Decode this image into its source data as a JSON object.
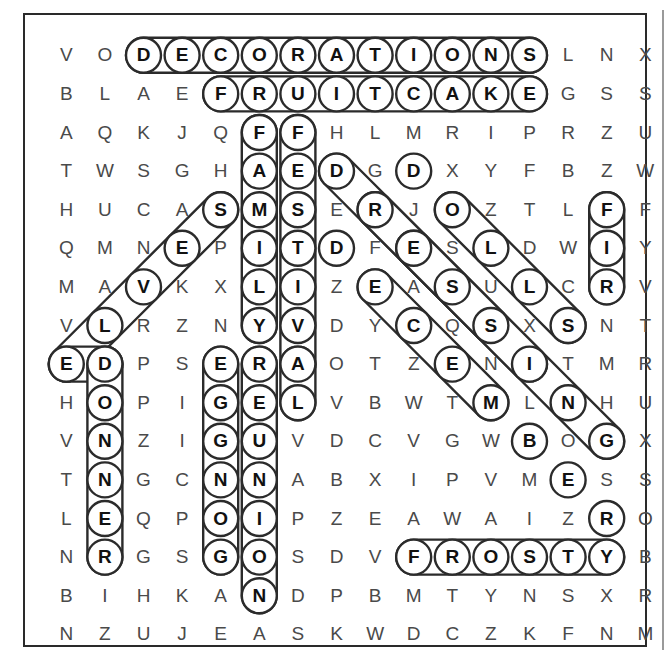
{
  "puzzle": {
    "type": "word-search",
    "rows": 16,
    "cols": 15,
    "grid": [
      [
        "V",
        "O",
        "D",
        "E",
        "C",
        "O",
        "R",
        "A",
        "T",
        "I",
        "O",
        "N",
        "S",
        "L",
        "N",
        "X"
      ],
      [
        "B",
        "L",
        "A",
        "E",
        "F",
        "R",
        "U",
        "I",
        "T",
        "C",
        "A",
        "K",
        "E",
        "G",
        "S",
        "S"
      ],
      [
        "A",
        "Q",
        "K",
        "J",
        "Q",
        "F",
        "F",
        "H",
        "L",
        "M",
        "R",
        "I",
        "P",
        "R",
        "Z",
        "U"
      ],
      [
        "T",
        "W",
        "S",
        "G",
        "H",
        "A",
        "E",
        "D",
        "G",
        "D",
        "X",
        "Y",
        "F",
        "B",
        "Z",
        "W"
      ],
      [
        "H",
        "U",
        "C",
        "A",
        "S",
        "M",
        "S",
        "E",
        "R",
        "J",
        "O",
        "Z",
        "T",
        "L",
        "F",
        "F"
      ],
      [
        "Q",
        "M",
        "N",
        "E",
        "P",
        "I",
        "T",
        "D",
        "F",
        "E",
        "S",
        "L",
        "D",
        "W",
        "I",
        "Y"
      ],
      [
        "M",
        "A",
        "V",
        "K",
        "X",
        "L",
        "I",
        "Z",
        "E",
        "A",
        "S",
        "U",
        "L",
        "C",
        "R",
        "V"
      ],
      [
        "V",
        "L",
        "R",
        "Z",
        "N",
        "Y",
        "V",
        "D",
        "Y",
        "C",
        "Q",
        "S",
        "X",
        "S",
        "N",
        "T"
      ],
      [
        "E",
        "D",
        "P",
        "S",
        "E",
        "R",
        "A",
        "O",
        "T",
        "Z",
        "E",
        "N",
        "I",
        "T",
        "M",
        "R"
      ],
      [
        "H",
        "O",
        "P",
        "I",
        "G",
        "E",
        "L",
        "V",
        "B",
        "W",
        "T",
        "M",
        "L",
        "N",
        "H",
        "U"
      ],
      [
        "V",
        "N",
        "Z",
        "I",
        "G",
        "U",
        "V",
        "D",
        "C",
        "V",
        "G",
        "W",
        "B",
        "O",
        "G",
        "X"
      ],
      [
        "T",
        "N",
        "G",
        "C",
        "N",
        "N",
        "A",
        "B",
        "X",
        "I",
        "P",
        "V",
        "M",
        "E",
        "S",
        "S"
      ],
      [
        "L",
        "E",
        "Q",
        "P",
        "O",
        "I",
        "P",
        "Z",
        "E",
        "A",
        "W",
        "A",
        "I",
        "Z",
        "R",
        "O"
      ],
      [
        "N",
        "R",
        "G",
        "S",
        "G",
        "O",
        "S",
        "D",
        "V",
        "F",
        "R",
        "O",
        "S",
        "T",
        "Y",
        "B"
      ],
      [
        "B",
        "I",
        "H",
        "K",
        "A",
        "N",
        "D",
        "P",
        "B",
        "M",
        "T",
        "Y",
        "N",
        "S",
        "X",
        "R"
      ],
      [
        "N",
        "Z",
        "U",
        "J",
        "E",
        "A",
        "S",
        "K",
        "W",
        "D",
        "C",
        "Z",
        "K",
        "F",
        "N",
        "M"
      ]
    ],
    "note_grid_is_16_rows_of_16_entries": "each row listed holds 16 letters; the 16th is the rightmost column",
    "found_words": [
      {
        "word": "DECORATIONS",
        "direction": "horizontal-right",
        "start": {
          "row": 0,
          "col": 2
        },
        "end": {
          "row": 0,
          "col": 12
        },
        "letters": [
          "D",
          "E",
          "C",
          "O",
          "R",
          "A",
          "T",
          "I",
          "O",
          "N",
          "S"
        ]
      },
      {
        "word": "FRUITCAKE",
        "direction": "horizontal-right",
        "start": {
          "row": 1,
          "col": 4
        },
        "end": {
          "row": 1,
          "col": 12
        },
        "letters": [
          "F",
          "R",
          "U",
          "I",
          "T",
          "C",
          "A",
          "K",
          "E"
        ]
      },
      {
        "word": "FAMILY",
        "direction": "vertical-down",
        "start": {
          "row": 2,
          "col": 5
        },
        "end": {
          "row": 7,
          "col": 5
        },
        "letters": [
          "F",
          "A",
          "M",
          "I",
          "L",
          "Y"
        ]
      },
      {
        "word": "FESTIVAL",
        "direction": "vertical-down",
        "start": {
          "row": 2,
          "col": 6
        },
        "end": {
          "row": 8,
          "col": 6
        },
        "letters": [
          "F",
          "E",
          "S",
          "T",
          "I",
          "V",
          "A"
        ]
      },
      {
        "word": "DECEMBER",
        "direction": "diagonal-down-right",
        "start": {
          "row": 3,
          "col": 7
        },
        "end": {
          "row": 10,
          "col": 14
        },
        "letters": [
          "D",
          "E",
          "C",
          "E",
          "M",
          "B",
          "E",
          "R"
        ]
      },
      {
        "word": "DONNER",
        "direction": "vertical-down",
        "start": {
          "row": 8,
          "col": 1
        },
        "end": {
          "row": 13,
          "col": 1
        },
        "letters": [
          "D",
          "O",
          "N",
          "N",
          "E",
          "R"
        ]
      },
      {
        "word": "EGGNOG",
        "direction": "vertical-down",
        "start": {
          "row": 8,
          "col": 4
        },
        "end": {
          "row": 13,
          "col": 4
        },
        "letters": [
          "E",
          "G",
          "G",
          "N",
          "O",
          "G"
        ]
      },
      {
        "word": "REGION",
        "direction": "vertical-down",
        "start": {
          "row": 8,
          "col": 5
        },
        "end": {
          "row": 14,
          "col": 5
        },
        "letters": [
          "R",
          "E",
          "G",
          "U",
          "N",
          "I",
          "O",
          "N"
        ]
      },
      {
        "word": "FROSTY",
        "direction": "horizontal-right",
        "start": {
          "row": 13,
          "col": 9
        },
        "end": {
          "row": 13,
          "col": 14
        },
        "letters": [
          "F",
          "R",
          "O",
          "S",
          "T",
          "Y"
        ]
      },
      {
        "word": "FIR",
        "direction": "vertical-down",
        "start": {
          "row": 4,
          "col": 14
        },
        "end": {
          "row": 6,
          "col": 14
        },
        "letters": [
          "F",
          "I",
          "R"
        ]
      },
      {
        "word": "BELIEVED",
        "direction": "diagonal-up-right",
        "start": {
          "row": 8,
          "col": 0
        },
        "end": {
          "row": 4,
          "col": 4
        },
        "letters": [
          "E",
          "L",
          "V",
          "E",
          "S"
        ]
      },
      {
        "word": "JOLLY",
        "direction": "diagonal-down-right",
        "start": {
          "row": 4,
          "col": 8
        },
        "end": {
          "row": 7,
          "col": 13
        },
        "letters": [
          "R",
          "E",
          "S",
          "C",
          "S"
        ]
      },
      {
        "word": "JOYOUS",
        "direction": "diagonal-down-right",
        "start": {
          "row": 4,
          "col": 9
        },
        "end": {
          "row": 7,
          "col": 13
        },
        "letters": [
          "J",
          "O",
          "L",
          "S"
        ]
      }
    ]
  },
  "marked_cells": [
    [
      0,
      2
    ],
    [
      0,
      3
    ],
    [
      0,
      4
    ],
    [
      0,
      5
    ],
    [
      0,
      6
    ],
    [
      0,
      7
    ],
    [
      0,
      8
    ],
    [
      0,
      9
    ],
    [
      0,
      10
    ],
    [
      0,
      11
    ],
    [
      0,
      12
    ],
    [
      1,
      4
    ],
    [
      1,
      5
    ],
    [
      1,
      6
    ],
    [
      1,
      7
    ],
    [
      1,
      8
    ],
    [
      1,
      9
    ],
    [
      1,
      10
    ],
    [
      1,
      11
    ],
    [
      1,
      12
    ],
    [
      2,
      5
    ],
    [
      2,
      6
    ],
    [
      3,
      5
    ],
    [
      3,
      6
    ],
    [
      3,
      7
    ],
    [
      3,
      9
    ],
    [
      4,
      4
    ],
    [
      4,
      5
    ],
    [
      4,
      6
    ],
    [
      4,
      8
    ],
    [
      4,
      10
    ],
    [
      4,
      14
    ],
    [
      5,
      3
    ],
    [
      5,
      5
    ],
    [
      5,
      6
    ],
    [
      5,
      7
    ],
    [
      5,
      9
    ],
    [
      5,
      11
    ],
    [
      5,
      14
    ],
    [
      6,
      2
    ],
    [
      6,
      5
    ],
    [
      6,
      6
    ],
    [
      6,
      8
    ],
    [
      6,
      10
    ],
    [
      6,
      12
    ],
    [
      6,
      14
    ],
    [
      7,
      1
    ],
    [
      7,
      5
    ],
    [
      7,
      6
    ],
    [
      7,
      9
    ],
    [
      7,
      11
    ],
    [
      7,
      13
    ],
    [
      8,
      0
    ],
    [
      8,
      1
    ],
    [
      8,
      4
    ],
    [
      8,
      5
    ],
    [
      8,
      6
    ],
    [
      8,
      10
    ],
    [
      8,
      12
    ],
    [
      9,
      1
    ],
    [
      9,
      4
    ],
    [
      9,
      5
    ],
    [
      9,
      6
    ],
    [
      9,
      11
    ],
    [
      9,
      13
    ],
    [
      10,
      1
    ],
    [
      10,
      4
    ],
    [
      10,
      5
    ],
    [
      10,
      12
    ],
    [
      10,
      14
    ],
    [
      11,
      1
    ],
    [
      11,
      4
    ],
    [
      11,
      5
    ],
    [
      11,
      13
    ],
    [
      12,
      1
    ],
    [
      12,
      4
    ],
    [
      12,
      5
    ],
    [
      12,
      14
    ],
    [
      13,
      1
    ],
    [
      13,
      4
    ],
    [
      13,
      5
    ],
    [
      13,
      9
    ],
    [
      13,
      10
    ],
    [
      13,
      11
    ],
    [
      13,
      12
    ],
    [
      13,
      13
    ],
    [
      13,
      14
    ],
    [
      14,
      5
    ]
  ],
  "geometry": {
    "cell_w": 38.6,
    "cell_h": 38.6,
    "origin_x": 22.0,
    "origin_y": 21.0
  },
  "colors": {
    "ink": "#4a4a4a",
    "ink_bold": "#111111",
    "stroke": "#2b2b2b",
    "frame": "#2a2a2a",
    "paper": "#ffffff"
  }
}
